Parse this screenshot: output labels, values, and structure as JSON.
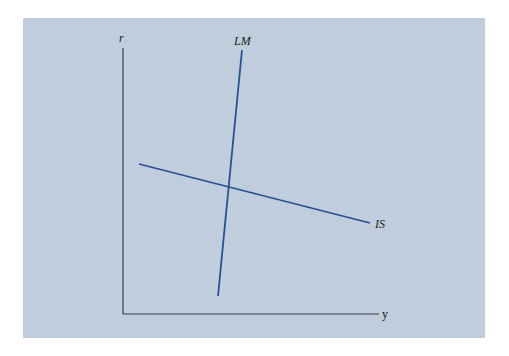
{
  "diagram": {
    "type": "IS-LM",
    "axes": {
      "y_axis_label": "r",
      "x_axis_label": "y"
    },
    "curves": [
      {
        "name": "LM",
        "label": "LM",
        "color": "#2b4f96",
        "from": [
          218,
          296
        ],
        "to": [
          242,
          50
        ]
      },
      {
        "name": "IS",
        "label": "IS",
        "color": "#2b4f96",
        "from": [
          139,
          164
        ],
        "to": [
          370,
          223
        ]
      }
    ],
    "colors": {
      "panel_background": "#bfcddc",
      "axis": "#3a3f47",
      "curve": "#2b4f96"
    }
  }
}
